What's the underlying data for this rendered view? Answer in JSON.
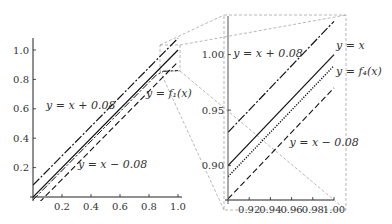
{
  "chart_data": [
    {
      "type": "line",
      "panel": "main",
      "xlim": [
        0,
        1.0
      ],
      "ylim": [
        0,
        1.05
      ],
      "x_ticks": [
        "0.2",
        "0.4",
        "0.6",
        "0.8",
        "1.0"
      ],
      "x_tick_values": [
        0.2,
        0.4,
        0.6,
        0.8,
        1.0
      ],
      "y_ticks": [
        "0.2",
        "0.4",
        "0.6",
        "0.8",
        "1.0"
      ],
      "y_tick_values": [
        0.2,
        0.4,
        0.6,
        0.8,
        1.0
      ],
      "series": [
        {
          "name": "y = x + 0.08",
          "style": "dashdot",
          "x": [
            0,
            1.0
          ],
          "y": [
            0.08,
            1.08
          ]
        },
        {
          "name": "y = x",
          "style": "solid",
          "x": [
            0,
            1.0
          ],
          "y": [
            0,
            1.0
          ]
        },
        {
          "name": "y = f1(x)",
          "style": "dashdot-thin",
          "x": [
            0,
            0.85,
            0.9,
            1.0
          ],
          "y": [
            -0.02,
            0.83,
            0.855,
            0.86
          ]
        },
        {
          "name": "y = x - 0.08",
          "style": "dashed",
          "x": [
            0,
            1.0
          ],
          "y": [
            -0.08,
            0.92
          ]
        }
      ],
      "annotations": [
        {
          "text": "y = x + 0.08",
          "x": 0.09,
          "y": 0.6
        },
        {
          "text": "y = f₁(x)",
          "x": 0.78,
          "y": 0.68
        },
        {
          "text": "y = x − 0.08",
          "x": 0.31,
          "y": 0.2
        }
      ]
    },
    {
      "type": "line",
      "panel": "zoom-inset",
      "xlim": [
        0.9,
        1.0
      ],
      "ylim": [
        0.869,
        1.033
      ],
      "x_ticks": [
        "0.92",
        "0.94",
        "0.96",
        "0.98",
        "1.00"
      ],
      "x_tick_values": [
        0.92,
        0.94,
        0.96,
        0.98,
        1.0
      ],
      "y_ticks": [
        "0.90",
        "0.95",
        "1.00"
      ],
      "y_tick_values": [
        0.9,
        0.95,
        1.0
      ],
      "series": [
        {
          "name": "y = x + 0.08",
          "style": "dashdot",
          "x": [
            0.9,
            1.0
          ],
          "y": [
            0.93,
            1.03
          ]
        },
        {
          "name": "y = x",
          "style": "solid",
          "x": [
            0.9,
            1.0
          ],
          "y": [
            0.9,
            1.0
          ]
        },
        {
          "name": "y = f4(x)",
          "style": "dotted",
          "x": [
            0.9,
            1.0
          ],
          "y": [
            0.89,
            0.99
          ]
        },
        {
          "name": "y = x - 0.08",
          "style": "dashed",
          "x": [
            0.9,
            1.0
          ],
          "y": [
            0.87,
            0.97
          ]
        }
      ],
      "annotations": [
        {
          "text": "y = x + 0.08",
          "x": 0.905,
          "y": 0.998
        },
        {
          "text": "y = x",
          "x": 1.002,
          "y": 1.005
        },
        {
          "text": "y = f₄(x)",
          "x": 1.002,
          "y": 0.982
        },
        {
          "text": "y = x − 0.08",
          "x": 0.958,
          "y": 0.918
        }
      ]
    }
  ]
}
